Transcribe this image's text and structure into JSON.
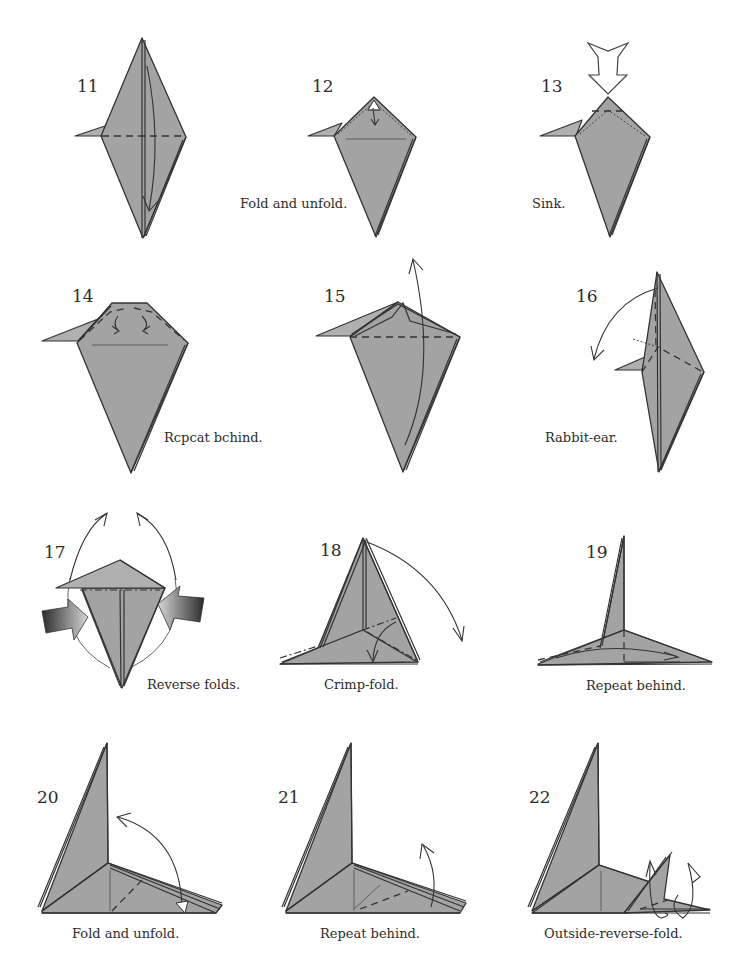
{
  "page": {
    "background": "#ffffff",
    "paper_color": "#a3a3a3",
    "line_color": "#333333"
  },
  "steps": [
    {
      "number": "11",
      "caption": ""
    },
    {
      "number": "12",
      "caption": "Fold and unfold."
    },
    {
      "number": "13",
      "caption": "Sink."
    },
    {
      "number": "14",
      "caption": "Rcpcat bchind."
    },
    {
      "number": "15",
      "caption": ""
    },
    {
      "number": "16",
      "caption": "Rabbit-ear."
    },
    {
      "number": "17",
      "caption": "Reverse folds."
    },
    {
      "number": "18",
      "caption": "Crimp-fold."
    },
    {
      "number": "19",
      "caption": "Repeat behind."
    },
    {
      "number": "20",
      "caption": "Fold and unfold."
    },
    {
      "number": "21",
      "caption": "Repeat behind."
    },
    {
      "number": "22",
      "caption": "Outside-reverse-fold."
    }
  ],
  "icons": {
    "valley-fold-arrow": "curved arrow",
    "sink-arrow": "hollow push arrow",
    "reverse-fold-arrow": "gradient push arrow"
  }
}
